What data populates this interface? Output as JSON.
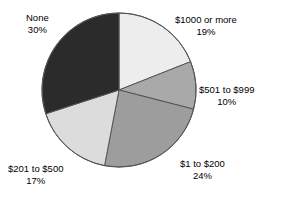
{
  "chart_data": {
    "type": "pie",
    "title": "",
    "subtitle": "",
    "xlabel": "",
    "ylabel": "",
    "grid": false,
    "legend_position": "none",
    "label_format": "name + percent",
    "start_angle_deg": 0,
    "direction": "clockwise",
    "center": {
      "x": 119,
      "y": 90
    },
    "radius": 77,
    "categories": [
      "$1000 or more",
      "$501 to $999",
      "$1 to $200",
      "$201 to $500",
      "None"
    ],
    "values": [
      19,
      10,
      24,
      17,
      30
    ],
    "slices": [
      {
        "label": "$1000 or more",
        "percent_text": "19%",
        "value": 19,
        "color": "#ededed",
        "start_deg": 0,
        "end_deg": 68.4
      },
      {
        "label": "$501 to $999",
        "percent_text": "10%",
        "value": 10,
        "color": "#a9a9a9",
        "start_deg": 68.4,
        "end_deg": 104.4
      },
      {
        "label": "$1 to $200",
        "percent_text": "24%",
        "value": 24,
        "color": "#9d9d9d",
        "start_deg": 104.4,
        "end_deg": 190.8
      },
      {
        "label": "$201 to $500",
        "percent_text": "17%",
        "value": 17,
        "color": "#dcdcdc",
        "start_deg": 190.8,
        "end_deg": 252.0
      },
      {
        "label": "None",
        "percent_text": "30%",
        "value": 30,
        "color": "#2b2b2b",
        "start_deg": 252.0,
        "end_deg": 360.0
      }
    ],
    "colors": {
      "outline": "#555555",
      "background": "#ffffff",
      "text": "#000000"
    }
  }
}
